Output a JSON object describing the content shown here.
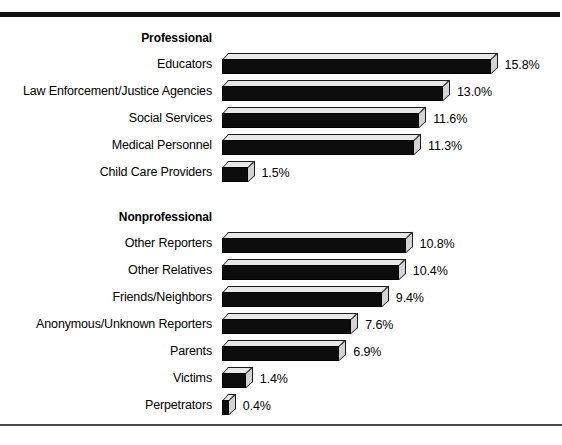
{
  "chart_data": {
    "type": "bar",
    "orientation": "horizontal",
    "title": "",
    "xlabel": "",
    "ylabel": "",
    "xlim": [
      0,
      15.8
    ],
    "grid": false,
    "legend": null,
    "value_suffix": "%",
    "groups": [
      {
        "header": "Professional",
        "categories": [
          "Educators",
          "Law Enforcement/Justice Agencies",
          "Social Services",
          "Medical Personnel",
          "Child Care Providers"
        ],
        "values": [
          15.8,
          13.0,
          11.6,
          11.3,
          1.5
        ],
        "labels": [
          "15.8%",
          "13.0%",
          "11.6%",
          "11.3%",
          "1.5%"
        ]
      },
      {
        "header": "Nonprofessional",
        "categories": [
          "Other Reporters",
          "Other Relatives",
          "Friends/Neighbors",
          "Anonymous/Unknown Reporters",
          "Parents",
          "Victims",
          "Perpetrators"
        ],
        "values": [
          10.8,
          10.4,
          9.4,
          7.6,
          6.9,
          1.4,
          0.4
        ],
        "labels": [
          "10.8%",
          "10.4%",
          "9.4%",
          "7.6%",
          "6.9%",
          "1.4%",
          "0.4%"
        ]
      }
    ]
  },
  "style": {
    "bar_fill": "#0d0d0d",
    "bar_top_face": "#e8e8e8",
    "bar_side_face": "#d4d4d4",
    "rule_color": "#111111",
    "background": "#ffffff"
  }
}
